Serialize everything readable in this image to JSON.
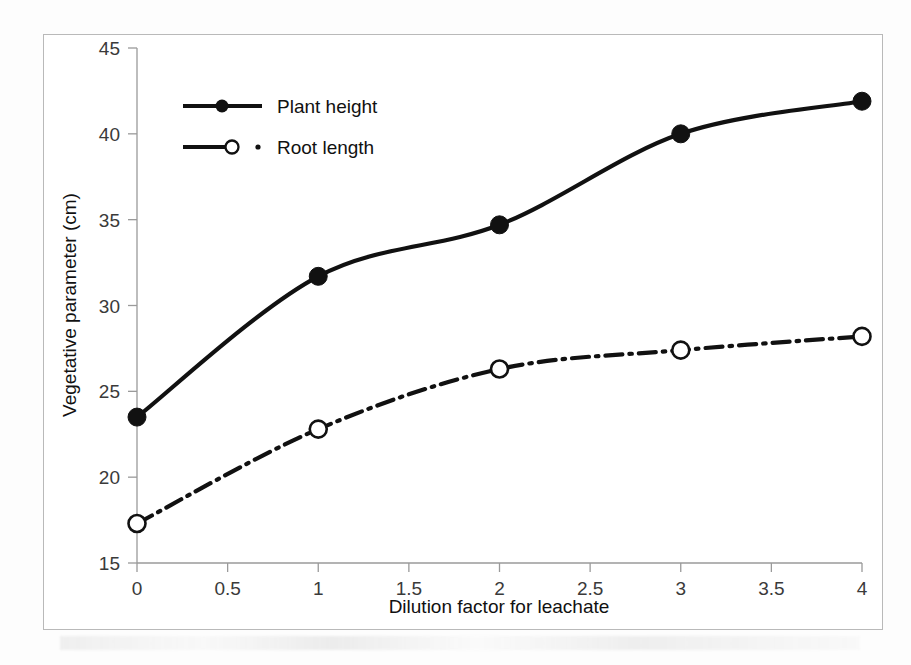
{
  "chart_data": {
    "type": "line",
    "title": "",
    "xlabel": "Dilution factor for leachate",
    "ylabel": "Vegetative parameter (cm)",
    "x": [
      0,
      1,
      2,
      3,
      4
    ],
    "xlim": [
      0,
      4
    ],
    "ylim": [
      15,
      45
    ],
    "xticks": [
      0,
      0.5,
      1,
      1.5,
      2,
      2.5,
      3,
      3.5,
      4
    ],
    "xtick_labels": [
      "0",
      "0.5",
      "1",
      "1.5",
      "2",
      "2.5",
      "3",
      "3.5",
      "4"
    ],
    "yticks": [
      15,
      20,
      25,
      30,
      35,
      40,
      45
    ],
    "ytick_labels": [
      "15",
      "20",
      "25",
      "30",
      "35",
      "40",
      "45"
    ],
    "grid": false,
    "legend_position": "upper-left-inside",
    "series": [
      {
        "name": "Plant height",
        "values": [
          23.5,
          31.7,
          34.7,
          40.0,
          41.9
        ],
        "line_style": "solid",
        "marker": "filled-circle",
        "color": "#111111"
      },
      {
        "name": "Root length",
        "values": [
          17.3,
          22.8,
          26.3,
          27.4,
          28.2
        ],
        "line_style": "dash-dot",
        "marker": "open-circle",
        "color": "#111111"
      }
    ]
  },
  "legend": {
    "items": [
      {
        "label": "Plant height"
      },
      {
        "label": "Root length"
      }
    ]
  },
  "axes": {
    "x_title": "Dilution factor for leachate",
    "y_title": "Vegetative parameter (cm)"
  }
}
